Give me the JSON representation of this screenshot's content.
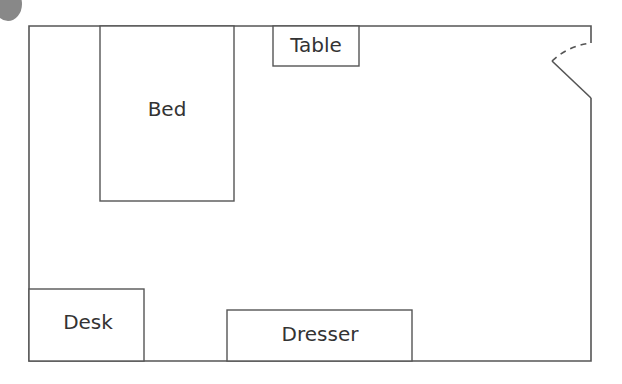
{
  "diagram": {
    "type": "floor-plan",
    "colors": {
      "wall": "#555555",
      "label": "#333333",
      "blob": "#888888",
      "background": "#ffffff"
    },
    "furniture": [
      {
        "id": "bed",
        "label": "Bed"
      },
      {
        "id": "table",
        "label": "Table"
      },
      {
        "id": "desk",
        "label": "Desk"
      },
      {
        "id": "dresser",
        "label": "Dresser"
      }
    ],
    "door": {
      "location": "top-right",
      "style": "swing with dashed arc"
    }
  }
}
